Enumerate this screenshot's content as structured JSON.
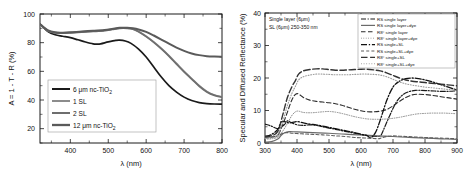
{
  "figure": {
    "name": "two-panel-optical-spectra-figure",
    "background": "#ffffff"
  },
  "panel_left": {
    "name": "absorptance-panel",
    "chart_data": {
      "type": "line",
      "title": "",
      "xlabel": "λ (nm)",
      "ylabel": "A = 1 - T - R (%)",
      "xlim": [
        320,
        800
      ],
      "ylim": [
        10,
        100
      ],
      "xticks": [
        400,
        500,
        600,
        700,
        800
      ],
      "yticks": [
        20,
        40,
        60,
        80,
        100
      ],
      "grid": false,
      "legend_position": "lower-left",
      "series": [
        {
          "name": "6 μm nc-TiO2",
          "label": "6 μm nc-TiO",
          "sub": "2",
          "color": "#1a1a1a",
          "width": 1.7,
          "x": [
            320,
            340,
            360,
            380,
            400,
            420,
            440,
            460,
            470,
            480,
            500,
            520,
            530,
            545,
            560,
            580,
            600,
            620,
            640,
            660,
            680,
            700,
            720,
            740,
            760,
            780,
            800
          ],
          "y": [
            93,
            88,
            85.5,
            84.5,
            83.5,
            82,
            80.5,
            79.2,
            79,
            79.2,
            80.5,
            81.6,
            81.8,
            81.2,
            79.5,
            75.5,
            70,
            63,
            56,
            50,
            45.5,
            42,
            39.6,
            38.2,
            37.5,
            37.2,
            37.1
          ]
        },
        {
          "name": "1 SL",
          "label": "1 SL",
          "sub": "",
          "color": "#8c8c8c",
          "width": 1.7,
          "x": [
            320,
            340,
            360,
            380,
            400,
            430,
            460,
            490,
            510,
            530,
            550,
            565,
            580,
            600,
            620,
            640,
            660,
            680,
            700,
            720,
            740,
            760,
            780,
            800
          ],
          "y": [
            93,
            88.5,
            87,
            86.8,
            87,
            87.5,
            88,
            88.6,
            89.4,
            90.2,
            90.2,
            89.6,
            87.8,
            84.5,
            80.5,
            76,
            71,
            65.5,
            60,
            55,
            50,
            46,
            43.5,
            42.2
          ]
        },
        {
          "name": "2 SL",
          "label": "2 SL",
          "sub": "",
          "color": "#6e6e6e",
          "width": 1.7,
          "x": [
            320,
            340,
            360,
            380,
            400,
            430,
            460,
            490,
            510,
            530,
            550,
            565,
            580,
            600,
            620,
            640,
            660,
            680,
            700,
            720,
            740,
            760,
            780,
            800
          ],
          "y": [
            93,
            88.3,
            86.8,
            86.6,
            86.8,
            87.3,
            87.8,
            88.4,
            89.2,
            90,
            90,
            89.4,
            87.6,
            84.2,
            80.2,
            75.6,
            70.6,
            65,
            59.6,
            54.6,
            49.6,
            45.6,
            43.2,
            42
          ]
        },
        {
          "name": "12 μm nc-TiO2",
          "label": "12 μm nc-TiO",
          "sub": "2",
          "color": "#5a5a5a",
          "width": 2.0,
          "x": [
            320,
            340,
            360,
            380,
            400,
            430,
            460,
            490,
            510,
            530,
            550,
            565,
            580,
            600,
            620,
            640,
            660,
            680,
            700,
            720,
            740,
            760,
            780,
            800
          ],
          "y": [
            93,
            88.8,
            87.2,
            87,
            87.2,
            87.8,
            88.3,
            88.9,
            89.6,
            90.4,
            90.4,
            90,
            89.2,
            87.5,
            85,
            82.2,
            79.3,
            76.6,
            74.3,
            72.5,
            71.3,
            70.6,
            70.3,
            70.2
          ]
        }
      ]
    }
  },
  "panel_right": {
    "name": "reflectance-panel",
    "annotations": [
      "Single layer (6μm)",
      "SL (6μm) 250-350 nm"
    ],
    "chart_data": {
      "type": "line",
      "title": "",
      "xlabel": "λ (nm)",
      "ylabel": "Specular and Diffused Reflectance (%)",
      "xlim": [
        300,
        900
      ],
      "ylim": [
        0,
        40
      ],
      "xticks": [
        300,
        400,
        500,
        600,
        700,
        800,
        900
      ],
      "yticks": [
        0,
        10,
        20,
        30,
        40
      ],
      "grid": false,
      "legend_position": "upper-right",
      "series": [
        {
          "name": "RS single layer",
          "label": "RS single layer",
          "color": "#1a1a1a",
          "width": 1.2,
          "dash": "5,1.6,1.2,1.6",
          "x": [
            300,
            320,
            340,
            360,
            370,
            380,
            400,
            420,
            440,
            460,
            480,
            500,
            520,
            540,
            560,
            580,
            600,
            620,
            640,
            660,
            670,
            690,
            710,
            730,
            750,
            770,
            790,
            810,
            830,
            850,
            870,
            890,
            900
          ],
          "y": [
            5.8,
            5.2,
            4.4,
            5.6,
            6.8,
            6.4,
            5.6,
            5.4,
            5.6,
            5.4,
            5.0,
            4.6,
            4.2,
            3.8,
            3.4,
            3.0,
            2.6,
            2.3,
            2.1,
            2.2,
            4.0,
            8.5,
            12.5,
            14.8,
            15.8,
            16.2,
            16.2,
            16.1,
            16.0,
            15.9,
            15.9,
            16.0,
            16.3
          ]
        },
        {
          "name": "RS single layer+dye",
          "label": "RS single layer+dye",
          "color": "#6a6a6a",
          "width": 1.2,
          "dash": "none",
          "x": [
            300,
            320,
            340,
            350,
            360,
            375,
            400,
            450,
            500,
            550,
            600,
            650,
            700,
            750,
            800,
            850,
            900
          ],
          "y": [
            0.3,
            0.4,
            1.2,
            2.3,
            3.1,
            3.5,
            3.4,
            3.2,
            3.0,
            2.7,
            2.5,
            2.2,
            2.0,
            1.7,
            1.5,
            1.3,
            1.1
          ]
        },
        {
          "name": "R8° single layer",
          "label": "R8° single layer",
          "color": "#2a2a2a",
          "width": 1.1,
          "dash": "4.5,2.5",
          "x": [
            300,
            320,
            340,
            355,
            370,
            385,
            400,
            420,
            440,
            460,
            480,
            500,
            520,
            540,
            560,
            580,
            600,
            620,
            640,
            660,
            680,
            700,
            720,
            740,
            760,
            780,
            800,
            820,
            840,
            860,
            880,
            900
          ],
          "y": [
            1.8,
            1.9,
            2.4,
            5.5,
            9.5,
            13.5,
            15.2,
            14.0,
            13.2,
            12.8,
            12.6,
            12.4,
            12.1,
            11.6,
            11.0,
            10.4,
            9.9,
            9.6,
            9.6,
            9.8,
            10.3,
            11.4,
            12.8,
            14.0,
            14.8,
            15.0,
            14.9,
            14.7,
            14.4,
            14.1,
            13.8,
            13.5
          ]
        },
        {
          "name": "R8° single layer+dye",
          "label": "R8° single layer+dye",
          "color": "#8a8a8a",
          "width": 1.0,
          "dash": "0.8,1.6",
          "x": [
            300,
            320,
            340,
            355,
            370,
            385,
            400,
            420,
            440,
            460,
            480,
            500,
            520,
            540,
            560,
            580,
            600,
            620,
            640,
            660,
            680,
            700,
            720,
            740,
            760,
            780,
            800,
            820,
            840,
            860,
            880,
            900
          ],
          "y": [
            1.2,
            1.3,
            1.8,
            3.6,
            6.0,
            8.6,
            9.8,
            9.4,
            9.3,
            9.4,
            9.6,
            9.7,
            9.5,
            9.1,
            8.6,
            8.1,
            7.7,
            7.4,
            7.3,
            7.3,
            7.4,
            7.6,
            7.9,
            8.3,
            8.7,
            9.0,
            9.1,
            9.2,
            9.2,
            9.2,
            9.1,
            9.0
          ]
        },
        {
          "name": "RS single+SL",
          "label": "RS single+SL",
          "color": "#111111",
          "width": 1.3,
          "dash": "6,1.8,1.3,1.8",
          "x": [
            300,
            320,
            340,
            350,
            360,
            375,
            390,
            400,
            420,
            440,
            460,
            480,
            500,
            520,
            540,
            560,
            580,
            600,
            620,
            630,
            645,
            660,
            680,
            700,
            720,
            740,
            760,
            780,
            800,
            830,
            860,
            890,
            900
          ],
          "y": [
            2.0,
            2.6,
            4.2,
            6.4,
            6.6,
            6.2,
            6.4,
            6.6,
            6.2,
            5.8,
            5.6,
            5.2,
            4.8,
            4.4,
            4.0,
            3.6,
            3.2,
            2.7,
            2.2,
            1.6,
            3.2,
            7.0,
            13.0,
            17.2,
            19.0,
            19.8,
            20.0,
            19.8,
            19.4,
            18.6,
            17.6,
            16.6,
            16.3
          ]
        },
        {
          "name": "RS single+SL+dye",
          "label": "RS single+SL+dye",
          "color": "#5f5f5f",
          "width": 1.1,
          "dash": "3,2.2",
          "x": [
            300,
            320,
            340,
            355,
            370,
            385,
            400,
            420,
            440,
            460,
            480,
            500,
            520,
            540,
            560,
            580,
            600,
            620,
            640,
            655,
            665,
            680,
            700,
            720,
            740,
            760,
            780,
            800,
            820,
            850,
            880,
            900
          ],
          "y": [
            1.5,
            1.7,
            2.2,
            3.0,
            3.2,
            3.0,
            2.9,
            2.8,
            2.7,
            2.6,
            2.5,
            2.4,
            2.2,
            2.1,
            1.9,
            1.7,
            1.6,
            1.5,
            1.4,
            1.3,
            1.6,
            2.0,
            2.2,
            2.1,
            2.0,
            1.9,
            1.8,
            1.7,
            1.6,
            1.5,
            1.4,
            1.3
          ]
        },
        {
          "name": "R8° single+SL",
          "label": "R8° single+SL",
          "color": "#333333",
          "width": 1.4,
          "dash": "6.5,2.6",
          "x": [
            300,
            320,
            340,
            355,
            370,
            385,
            395,
            405,
            420,
            440,
            460,
            480,
            500,
            520,
            540,
            560,
            580,
            600,
            620,
            640,
            660,
            680,
            700,
            720,
            740,
            760,
            780,
            800,
            820,
            840,
            860,
            880,
            900
          ],
          "y": [
            2.0,
            2.2,
            3.6,
            8.5,
            14.0,
            17.5,
            19.2,
            21.2,
            22.2,
            22.6,
            22.8,
            22.8,
            22.6,
            22.4,
            22.4,
            22.5,
            22.6,
            22.7,
            22.7,
            22.5,
            22.2,
            21.6,
            20.8,
            20.0,
            19.4,
            19.0,
            18.8,
            18.6,
            18.4,
            18.2,
            18.0,
            17.8,
            17.6
          ]
        },
        {
          "name": "R8° single+SL+dye",
          "label": "R8° single+SL+dye",
          "color": "#9b9b9b",
          "width": 1.1,
          "dash": "0.9,1.7",
          "x": [
            300,
            320,
            340,
            355,
            370,
            385,
            395,
            405,
            420,
            440,
            460,
            480,
            500,
            520,
            540,
            560,
            580,
            600,
            620,
            640,
            660,
            680,
            700,
            720,
            740,
            760,
            780,
            800,
            820,
            840,
            860,
            880,
            900
          ],
          "y": [
            1.4,
            1.6,
            2.6,
            6.5,
            11.5,
            15.5,
            17.4,
            19.4,
            20.4,
            20.9,
            21.2,
            21.2,
            21.1,
            21.0,
            21.0,
            21.0,
            21.1,
            21.2,
            21.2,
            21.1,
            20.9,
            20.4,
            19.6,
            18.8,
            18.2,
            17.8,
            17.5,
            17.2,
            17.0,
            16.8,
            16.6,
            16.4,
            16.2
          ]
        }
      ]
    }
  }
}
